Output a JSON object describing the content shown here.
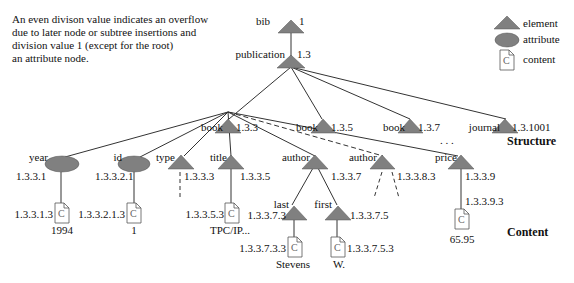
{
  "note": {
    "lines": [
      "An even divison value indicates an overflow",
      "due to later node or subtree insertions and",
      "division value 1 (except for the root)",
      "an attribute node."
    ]
  },
  "legend": {
    "items": [
      {
        "shape": "triangle",
        "label": "element"
      },
      {
        "shape": "ellipse",
        "label": "attribute"
      },
      {
        "shape": "document",
        "label": "content"
      }
    ]
  },
  "sections": {
    "structure": "Structure",
    "content": "Content"
  },
  "colors": {
    "node_fill": "#808080",
    "line": "#333333",
    "background": "#ffffff"
  },
  "nodes": {
    "bib": {
      "label": "bib",
      "id": "1"
    },
    "publication": {
      "label": "publication",
      "id": "1.3"
    },
    "book1": {
      "label": "book",
      "id": "1.3.3"
    },
    "book2": {
      "label": "book",
      "id": "1.3.5"
    },
    "book3": {
      "label": "book",
      "id": "1.3.7"
    },
    "journal": {
      "label": "journal",
      "id": "1.3.1001"
    },
    "ellipsis": ". . .",
    "year": {
      "label": "year",
      "id": "1.3.3.1"
    },
    "id": {
      "label": "id",
      "id": "1.3.3.2.1"
    },
    "type": {
      "label": "type",
      "id": "1.3.3.3"
    },
    "title": {
      "label": "title",
      "id": "1.3.3.5"
    },
    "author1": {
      "label": "author",
      "id": "1.3.3.7"
    },
    "author2": {
      "label": "author",
      "id": "1.3.3.8.3"
    },
    "price": {
      "label": "price",
      "id": "1.3.3.9"
    },
    "last": {
      "label": "last",
      "id": "1.3.3.7.3"
    },
    "first": {
      "label": "first",
      "id": "1.3.3.7.5"
    },
    "year_content": {
      "id": "1.3.3.1.3",
      "value": "1994"
    },
    "id_content": {
      "id": "1.3.3.2.1.3",
      "value": "1"
    },
    "title_content": {
      "id": "1.3.3.5.3",
      "value": "TPC/IP..."
    },
    "price_content": {
      "id": "1.3.3.9.3",
      "value": "65.95"
    },
    "last_content": {
      "id": "1.3.3.7.3.3",
      "value": "Stevens"
    },
    "first_content": {
      "id": "1.3.3.7.5.3",
      "value": "W."
    }
  }
}
